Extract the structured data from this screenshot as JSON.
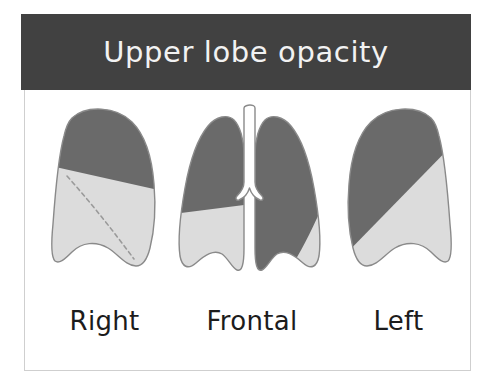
{
  "figure": {
    "title": "Upper lobe opacity",
    "banner_color": "#414141",
    "banner_text_color": "#f2f2f2",
    "card_background": "#ffffff",
    "card_border_color": "#cfcfcf"
  },
  "legend_colors": {
    "opacified_lobe": "#6a6a6a",
    "normal_lung": "#dcdcdc",
    "outline": "#8a8a8a",
    "fissure_dashed": "#9a9a9a",
    "airway": "#ffffff"
  },
  "panels": [
    {
      "id": "right",
      "caption": "Right",
      "view": "lateral",
      "icon": "lung-lateral-right-icon",
      "regions": [
        {
          "name": "upper-lobe",
          "shading": "opacified",
          "color": "#6a6a6a"
        },
        {
          "name": "lower-lobe",
          "shading": "normal",
          "color": "#dcdcdc"
        }
      ],
      "fissure": {
        "type": "oblique",
        "style": "dashed"
      }
    },
    {
      "id": "frontal",
      "caption": "Frontal",
      "view": "frontal",
      "icon": "lungs-frontal-icon",
      "regions": [
        {
          "name": "right-upper-lobe",
          "shading": "opacified",
          "color": "#6a6a6a"
        },
        {
          "name": "right-lower-lobe",
          "shading": "normal",
          "color": "#dcdcdc"
        },
        {
          "name": "left-upper-lobe",
          "shading": "opacified",
          "color": "#6a6a6a"
        },
        {
          "name": "left-lower-lobe",
          "shading": "normal",
          "color": "#dcdcdc"
        },
        {
          "name": "trachea",
          "shading": "airway",
          "color": "#ffffff"
        }
      ]
    },
    {
      "id": "left",
      "caption": "Left",
      "view": "lateral",
      "icon": "lung-lateral-left-icon",
      "regions": [
        {
          "name": "upper-lobe",
          "shading": "opacified",
          "color": "#6a6a6a"
        },
        {
          "name": "lower-lobe",
          "shading": "normal",
          "color": "#dcdcdc"
        }
      ]
    }
  ]
}
